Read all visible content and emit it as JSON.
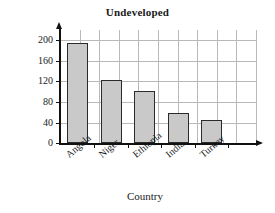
{
  "chart_data": {
    "type": "bar",
    "title": "Undeveloped",
    "xlabel": "Country",
    "ylabel": "IMR per 1000 births",
    "categories": [
      "Angola",
      "Niger",
      "Ethiopia",
      "India",
      "Turkey"
    ],
    "values": [
      195,
      123,
      102,
      59,
      44
    ],
    "ylim": [
      0,
      220
    ],
    "yticks": [
      0,
      40,
      80,
      120,
      160,
      200
    ],
    "ytick_labels": [
      "0",
      "40",
      "80",
      "120",
      "160",
      "200"
    ],
    "grid": true,
    "grid_vertical_count": 10,
    "legend": null,
    "bar_fill_color": "#c9c9c9",
    "bar_edge_color": "#2b2b2b",
    "grid_color": "#b9b9b9",
    "axis_color": "#111111"
  }
}
